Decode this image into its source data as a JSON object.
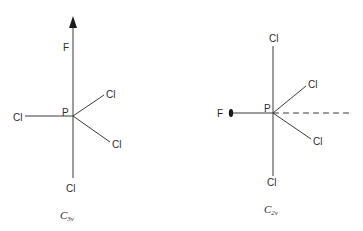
{
  "diagrams": [
    {
      "id": "pfcl4-c3v",
      "point_group": {
        "main": "C",
        "subscript": "3v"
      },
      "central_atom": "P",
      "axis_atom": "F",
      "axis_marker": "triangle-arrowhead (C3 axis)",
      "ligands": [
        "F",
        "Cl",
        "Cl",
        "Cl",
        "Cl"
      ],
      "labels": {
        "f": "F",
        "p": "P",
        "cl_left": "Cl",
        "cl_upper_right": "Cl",
        "cl_lower_right": "Cl",
        "cl_bottom": "Cl"
      }
    },
    {
      "id": "pfcl4-c2v",
      "point_group": {
        "main": "C",
        "subscript": "2v"
      },
      "central_atom": "P",
      "axis_atom": "F",
      "axis_marker": "ellipse (C2 axis)",
      "ligands": [
        "F",
        "Cl",
        "Cl",
        "Cl",
        "Cl"
      ],
      "labels": {
        "f": "F",
        "p": "P",
        "cl_top": "Cl",
        "cl_upper_right": "Cl",
        "cl_lower_right": "Cl",
        "cl_bottom": "Cl"
      }
    }
  ],
  "colors": {
    "line": "#3a3a3a",
    "text": "#2a2a2a",
    "background": "#ffffff"
  }
}
